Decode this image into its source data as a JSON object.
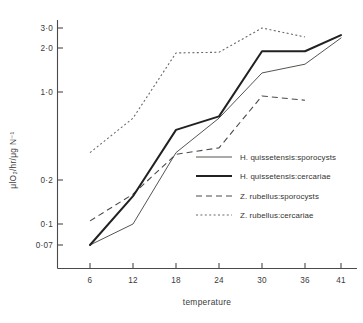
{
  "chart_data": {
    "type": "line",
    "title": "",
    "subtitle": "",
    "xlabel": "temperature",
    "ylabel": "μlO₂/hr/μg N⁻¹",
    "x": [
      6,
      12,
      18,
      24,
      30,
      36,
      41
    ],
    "xtick_labels": [
      "6",
      "12",
      "18",
      "24",
      "30",
      "36",
      "41"
    ],
    "yscale": "log",
    "ytick_values": [
      0.07,
      0.1,
      0.2,
      1.0,
      2.0,
      3.0
    ],
    "ytick_labels": [
      "0·07",
      "0·1",
      "0·2",
      "1·0",
      "2·0",
      "3·0"
    ],
    "ylim": [
      0.055,
      3.4
    ],
    "grid": false,
    "legend_position": "inside-right-middle",
    "series": [
      {
        "name": "H. quissetensis:sporocysts",
        "style": "solid-thin",
        "color": "#55554f",
        "x": [
          6,
          12,
          18,
          24,
          30,
          36,
          41
        ],
        "values": [
          0.07,
          0.1,
          0.33,
          0.62,
          1.35,
          1.55,
          2.45
        ]
      },
      {
        "name": "H. quissetensis:cercariae",
        "style": "solid-thick",
        "color": "#212121",
        "x": [
          6,
          12,
          18,
          24,
          30,
          36,
          41
        ],
        "values": [
          0.07,
          0.155,
          0.5,
          0.64,
          1.9,
          1.9,
          2.6
        ]
      },
      {
        "name": "Z. rubellus:sporocysts",
        "style": "dashed",
        "color": "#4a4a46",
        "x": [
          6,
          12,
          18,
          24,
          30,
          36
        ],
        "values": [
          0.105,
          0.16,
          0.32,
          0.36,
          0.93,
          0.86
        ]
      },
      {
        "name": "Z. rubellus:cercariae",
        "style": "dotted",
        "color": "#6a6a64",
        "x": [
          6,
          12,
          18,
          24,
          30,
          36
        ],
        "values": [
          0.33,
          0.62,
          1.85,
          1.87,
          3.0,
          2.5
        ]
      }
    ]
  },
  "legend": {
    "items": [
      {
        "label": "H. quissetensis:sporocysts",
        "style": "solid-thin"
      },
      {
        "label": "H. quissetensis:cercariae",
        "style": "solid-thick"
      },
      {
        "label": "Z. rubellus:sporocysts",
        "style": "dashed"
      },
      {
        "label": "Z. rubellus:cercariae",
        "style": "dotted"
      }
    ]
  },
  "axes": {
    "x_title": "temperature",
    "y_title": "μlO₂/hr/μg N⁻¹"
  }
}
